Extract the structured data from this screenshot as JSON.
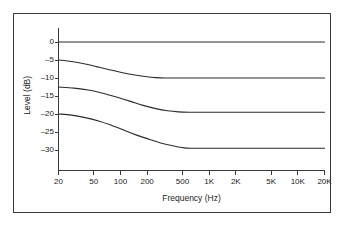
{
  "chart_data": {
    "type": "line",
    "title": "",
    "xlabel": "Frequency (Hz)",
    "ylabel": "Level (dB)",
    "xscale": "log",
    "xlim": [
      20,
      20000
    ],
    "ylim": [
      -33,
      2
    ],
    "grid": false,
    "legend": "none",
    "xticks": [
      {
        "value": 20,
        "label": "20"
      },
      {
        "value": 50,
        "label": "50"
      },
      {
        "value": 100,
        "label": "100"
      },
      {
        "value": 200,
        "label": "200"
      },
      {
        "value": 500,
        "label": "500"
      },
      {
        "value": 1000,
        "label": "1K"
      },
      {
        "value": 2000,
        "label": "2K"
      },
      {
        "value": 5000,
        "label": "5K"
      },
      {
        "value": 10000,
        "label": "10K"
      },
      {
        "value": 20000,
        "label": "20K"
      }
    ],
    "yticks": [
      {
        "value": 0,
        "label": "0"
      },
      {
        "value": -5,
        "label": "–5"
      },
      {
        "value": -10,
        "label": "–10"
      },
      {
        "value": -15,
        "label": "–15"
      },
      {
        "value": -20,
        "label": "–20"
      },
      {
        "value": -25,
        "label": "–25"
      },
      {
        "value": -30,
        "label": "–30"
      }
    ],
    "series": [
      {
        "name": "curve-0db-flat",
        "color": "#2b2b2b",
        "points": [
          [
            20,
            0
          ],
          [
            50,
            0
          ],
          [
            100,
            0
          ],
          [
            200,
            0
          ],
          [
            500,
            0
          ],
          [
            1000,
            0
          ],
          [
            2000,
            0
          ],
          [
            5000,
            0
          ],
          [
            10000,
            0
          ],
          [
            20000,
            0
          ]
        ]
      },
      {
        "name": "curve-minus5-to-minus10",
        "color": "#2b2b2b",
        "points": [
          [
            20,
            -5.0
          ],
          [
            28,
            -5.4
          ],
          [
            40,
            -6.1
          ],
          [
            55,
            -6.9
          ],
          [
            75,
            -7.7
          ],
          [
            100,
            -8.4
          ],
          [
            140,
            -9.1
          ],
          [
            190,
            -9.6
          ],
          [
            250,
            -9.9
          ],
          [
            320,
            -10.0
          ],
          [
            500,
            -10.0
          ],
          [
            1000,
            -10.0
          ],
          [
            2000,
            -10.0
          ],
          [
            5000,
            -10.0
          ],
          [
            10000,
            -10.0
          ],
          [
            20000,
            -10.0
          ]
        ]
      },
      {
        "name": "curve-minus12p5-to-minus19p5",
        "color": "#2b2b2b",
        "points": [
          [
            20,
            -12.5
          ],
          [
            30,
            -12.8
          ],
          [
            45,
            -13.4
          ],
          [
            65,
            -14.3
          ],
          [
            90,
            -15.3
          ],
          [
            130,
            -16.5
          ],
          [
            180,
            -17.6
          ],
          [
            250,
            -18.5
          ],
          [
            340,
            -19.1
          ],
          [
            450,
            -19.4
          ],
          [
            600,
            -19.5
          ],
          [
            1000,
            -19.5
          ],
          [
            2000,
            -19.5
          ],
          [
            5000,
            -19.5
          ],
          [
            10000,
            -19.5
          ],
          [
            20000,
            -19.5
          ]
        ]
      },
      {
        "name": "curve-minus20-to-minus29p5",
        "color": "#2b2b2b",
        "points": [
          [
            20,
            -20.0
          ],
          [
            28,
            -20.3
          ],
          [
            40,
            -21.0
          ],
          [
            58,
            -22.0
          ],
          [
            80,
            -23.2
          ],
          [
            110,
            -24.5
          ],
          [
            150,
            -25.8
          ],
          [
            210,
            -27.0
          ],
          [
            290,
            -28.1
          ],
          [
            400,
            -28.9
          ],
          [
            520,
            -29.4
          ],
          [
            650,
            -29.5
          ],
          [
            1000,
            -29.5
          ],
          [
            2000,
            -29.5
          ],
          [
            5000,
            -29.5
          ],
          [
            10000,
            -29.5
          ],
          [
            20000,
            -29.5
          ]
        ]
      }
    ]
  },
  "axis": {
    "x_title": "Frequency (Hz)",
    "y_title": "Level (dB)"
  },
  "style": {
    "line_color": "#2b2b2b",
    "axis_color": "#3a3a3a",
    "border_color": "#3a3a3a",
    "background": "#ffffff",
    "text_color": "#1d1d1d"
  }
}
